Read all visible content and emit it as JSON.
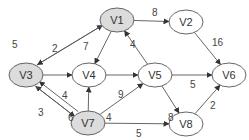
{
  "diagram": {
    "type": "weighted-directed-graph",
    "colors": {
      "highlight_fill": "#dcdcdc",
      "normal_fill": "#ffffff",
      "stroke": "#555555"
    },
    "nodes": [
      {
        "id": "V1",
        "label": "V1",
        "x": 117,
        "y": 20,
        "highlighted": true
      },
      {
        "id": "V2",
        "label": "V2",
        "x": 186,
        "y": 22,
        "highlighted": false
      },
      {
        "id": "V3",
        "label": "V3",
        "x": 26,
        "y": 75,
        "highlighted": true
      },
      {
        "id": "V4",
        "label": "V4",
        "x": 89,
        "y": 75,
        "highlighted": false
      },
      {
        "id": "V5",
        "label": "V5",
        "x": 155,
        "y": 75,
        "highlighted": false
      },
      {
        "id": "V6",
        "label": "V6",
        "x": 229,
        "y": 75,
        "highlighted": false
      },
      {
        "id": "V7",
        "label": "V7",
        "x": 88,
        "y": 123,
        "highlighted": true
      },
      {
        "id": "V8",
        "label": "V8",
        "x": 186,
        "y": 124,
        "highlighted": false
      }
    ],
    "edges": [
      {
        "from": "V3",
        "to": "V1",
        "weight": "5",
        "lx": 12,
        "ly": 48
      },
      {
        "from": "V1",
        "to": "V3",
        "weight": "2",
        "lx": 52,
        "ly": 52
      },
      {
        "from": "V1",
        "to": "V2",
        "weight": "8",
        "lx": 152,
        "ly": 16
      },
      {
        "from": "V1",
        "to": "V4",
        "weight": "7",
        "lx": 83,
        "ly": 50
      },
      {
        "from": "V2",
        "to": "V6",
        "weight": "16",
        "lx": 212,
        "ly": 46
      },
      {
        "from": "V5",
        "to": "V1",
        "weight": "4",
        "lx": 130,
        "ly": 48
      },
      {
        "from": "V3",
        "to": "V4",
        "weight": "",
        "lx": 0,
        "ly": 0
      },
      {
        "from": "V4",
        "to": "V5",
        "weight": "",
        "lx": 0,
        "ly": 0
      },
      {
        "from": "V5",
        "to": "V6",
        "weight": "5",
        "lx": 190,
        "ly": 88
      },
      {
        "from": "V5",
        "to": "V8",
        "weight": "8",
        "lx": 168,
        "ly": 121
      },
      {
        "from": "V8",
        "to": "V6",
        "weight": "2",
        "lx": 210,
        "ly": 109
      },
      {
        "from": "V7",
        "to": "V3",
        "weight": "4",
        "lx": 62,
        "ly": 99
      },
      {
        "from": "V3",
        "to": "V7",
        "weight": "3",
        "lx": 38,
        "ly": 116
      },
      {
        "from": "V7",
        "to": "V3",
        "weight": "6",
        "lx": 68,
        "ly": 121
      },
      {
        "from": "V7",
        "to": "V4",
        "weight": "4",
        "lx": 106,
        "ly": 121
      },
      {
        "from": "V7",
        "to": "V5",
        "weight": "9",
        "lx": 118,
        "ly": 98
      },
      {
        "from": "V7",
        "to": "V8",
        "weight": "5",
        "lx": 136,
        "ly": 137
      }
    ]
  }
}
